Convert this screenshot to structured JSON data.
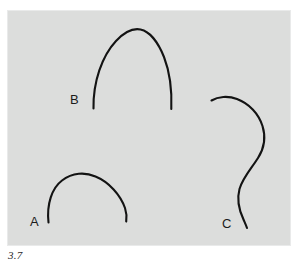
{
  "figure": {
    "caption": "3.7",
    "background_color": "#ffffff",
    "panel_color": "#dcdddc",
    "panel_border_color": "#e9eaea",
    "ink_color": "#131313",
    "panel": {
      "x": 7,
      "y": 10,
      "width": 284,
      "height": 236
    }
  },
  "chart_data": {
    "type": "line",
    "title": "3.7",
    "xlabel": "",
    "ylabel": "",
    "grid": false,
    "legend": "none",
    "axis_ranges": {
      "x": [
        7,
        291
      ],
      "y": [
        10,
        246
      ]
    },
    "series": [
      {
        "name": "A",
        "label": "A",
        "shape": "low-arch",
        "stroke": "#131313",
        "path": "M 48.5,222.5 C 46.5,204 52,188 62,180.5 C 72.5,172.5 85,172 95.5,176.5 C 109,182 120.5,195 125,208 C 126.5,212.5 126.8,217 126.2,221.5",
        "label_position": {
          "x": 30,
          "y": 226
        },
        "endpoints": [
          {
            "x": 48.5,
            "y": 222.5
          },
          {
            "x": 126.2,
            "y": 221.5
          }
        ],
        "apex": {
          "x": 88,
          "y": 174
        }
      },
      {
        "name": "B",
        "label": "B",
        "shape": "tall-parabolic-arch",
        "stroke": "#131313",
        "path": "M 93.5,108.5 C 93,82 102,56 116,41 C 124,32.5 133,28 140.5,29.5 C 150,31.5 158.5,43 164,57 C 170,72.5 172,91 171.3,109",
        "label_position": {
          "x": 70,
          "y": 104
        },
        "endpoints": [
          {
            "x": 93.5,
            "y": 108.5
          },
          {
            "x": 171.3,
            "y": 109
          }
        ],
        "apex": {
          "x": 137,
          "y": 29
        }
      },
      {
        "name": "C",
        "label": "C",
        "shape": "s-curve",
        "stroke": "#131313",
        "path": "M 211.5,100.5 C 218,96.5 228,95.5 237,99 C 249,103.5 258.5,113.5 262.5,126 C 266,137 264,148.5 258,158 C 251,169 242.5,178 239.5,189 C 236.5,200 239.5,211 243.5,219.5 C 245,223 246.3,225.8 247,228",
        "label_position": {
          "x": 222,
          "y": 228
        },
        "endpoints": [
          {
            "x": 211.5,
            "y": 100.5
          },
          {
            "x": 247,
            "y": 228
          }
        ],
        "rightmost": {
          "x": 264,
          "y": 135
        }
      }
    ]
  }
}
